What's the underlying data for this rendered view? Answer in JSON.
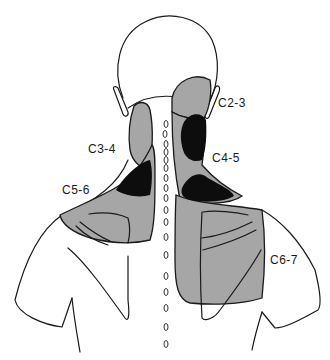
{
  "figure": {
    "type": "cervical-facet-pain-referral-map",
    "view": "posterior head, neck and shoulders",
    "colors": {
      "outline": "#1a1a1a",
      "referral_zone": "#a6a6a6",
      "overlap_zone": "#0d0d0d",
      "background": "#ffffff"
    },
    "labels": [
      {
        "id": "c2-3",
        "text": "C2-3",
        "x": 218,
        "y": 107
      },
      {
        "id": "c3-4",
        "text": "C3-4",
        "x": 88,
        "y": 153
      },
      {
        "id": "c4-5",
        "text": "C4-5",
        "x": 212,
        "y": 162
      },
      {
        "id": "c5-6",
        "text": "C5-6",
        "x": 62,
        "y": 194
      },
      {
        "id": "c6-7",
        "text": "C6-7",
        "x": 270,
        "y": 264
      }
    ]
  }
}
